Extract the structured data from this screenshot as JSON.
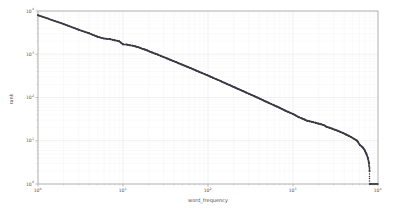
{
  "chart_data": {
    "type": "scatter",
    "title": "",
    "xlabel": "word_frequency",
    "ylabel": "rank",
    "xscale": "log",
    "yscale": "log",
    "xlim": [
      1,
      10000
    ],
    "ylim": [
      1,
      10000
    ],
    "grid": true,
    "legend": null,
    "marker": {
      "shape": "circle",
      "color": "#3b3b46",
      "size_px": 1.5
    },
    "xtick_labels": [
      "10^0",
      "10^1",
      "10^2",
      "10^3",
      "10^4"
    ],
    "xtick_values": [
      1,
      10,
      100,
      1000,
      10000
    ],
    "ytick_labels": [
      "10^0",
      "10^1",
      "10^2",
      "10^3",
      "10^4"
    ],
    "ytick_values": [
      1,
      10,
      100,
      1000,
      10000
    ],
    "points": [
      [
        1,
        8000
      ],
      [
        2,
        5000
      ],
      [
        3,
        3700
      ],
      [
        4,
        3050
      ],
      [
        5,
        2550
      ],
      [
        6,
        2300
      ],
      [
        7,
        2250
      ],
      [
        8,
        2100
      ],
      [
        9,
        2000
      ],
      [
        10,
        1700
      ],
      [
        11,
        1680
      ],
      [
        12,
        1620
      ],
      [
        13,
        1580
      ],
      [
        14,
        1520
      ],
      [
        15,
        1460
      ],
      [
        16,
        1400
      ],
      [
        17,
        1330
      ],
      [
        18,
        1290
      ],
      [
        19,
        1240
      ],
      [
        20,
        1180
      ],
      [
        22,
        1100
      ],
      [
        24,
        1030
      ],
      [
        26,
        970
      ],
      [
        28,
        910
      ],
      [
        30,
        860
      ],
      [
        33,
        800
      ],
      [
        36,
        745
      ],
      [
        39,
        700
      ],
      [
        42,
        660
      ],
      [
        45,
        620
      ],
      [
        49,
        580
      ],
      [
        53,
        545
      ],
      [
        57,
        512
      ],
      [
        62,
        480
      ],
      [
        67,
        450
      ],
      [
        72,
        423
      ],
      [
        78,
        396
      ],
      [
        84,
        372
      ],
      [
        91,
        348
      ],
      [
        98,
        327
      ],
      [
        106,
        306
      ],
      [
        114,
        287
      ],
      [
        123,
        269
      ],
      [
        133,
        252
      ],
      [
        143,
        236
      ],
      [
        154,
        221
      ],
      [
        166,
        207
      ],
      [
        179,
        194
      ],
      [
        193,
        181
      ],
      [
        208,
        170
      ],
      [
        224,
        159
      ],
      [
        242,
        149
      ],
      [
        261,
        139
      ],
      [
        281,
        130
      ],
      [
        303,
        122
      ],
      [
        327,
        114
      ],
      [
        352,
        107
      ],
      [
        380,
        100
      ],
      [
        410,
        93
      ],
      [
        442,
        87
      ],
      [
        476,
        81
      ],
      [
        513,
        76
      ],
      [
        553,
        71
      ],
      [
        596,
        66
      ],
      [
        643,
        62
      ],
      [
        693,
        58
      ],
      [
        747,
        54
      ],
      [
        805,
        50
      ],
      [
        868,
        47
      ],
      [
        936,
        44
      ],
      [
        1009,
        41
      ],
      [
        1088,
        38
      ],
      [
        1173,
        35
      ],
      [
        1264,
        33
      ],
      [
        1363,
        31
      ],
      [
        1469,
        29
      ],
      [
        1584,
        28
      ],
      [
        1707,
        27
      ],
      [
        1840,
        26
      ],
      [
        1984,
        25
      ],
      [
        2139,
        24
      ],
      [
        2306,
        23
      ],
      [
        2486,
        21
      ],
      [
        2680,
        20
      ],
      [
        2889,
        19
      ],
      [
        3114,
        18
      ],
      [
        3357,
        17
      ],
      [
        3619,
        16
      ],
      [
        3901,
        15
      ],
      [
        4205,
        14
      ],
      [
        4533,
        13
      ],
      [
        4886,
        12
      ],
      [
        5267,
        11
      ],
      [
        5678,
        10
      ],
      [
        6121,
        8
      ],
      [
        6598,
        7
      ],
      [
        7000,
        6
      ],
      [
        7300,
        5
      ],
      [
        7600,
        4
      ],
      [
        7850,
        3
      ],
      [
        7950,
        2
      ],
      [
        8000,
        1
      ]
    ]
  },
  "figure": {
    "background_color": "#ffffff",
    "axes_color": "#9a9a9a",
    "grid_color": "#e8e8e8",
    "tick_color": "#555555"
  }
}
